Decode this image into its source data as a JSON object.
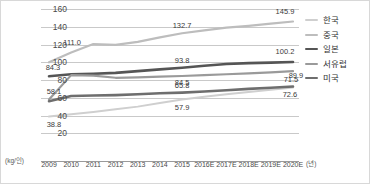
{
  "chart_data": {
    "type": "line",
    "title": "",
    "xlabel": "(년)",
    "ylabel": "(kg/인)",
    "ylim": [
      0,
      160
    ],
    "yticks": [
      160,
      140,
      120,
      100,
      80,
      60,
      40,
      20
    ],
    "grid": true,
    "legend_position": "right",
    "categories": [
      "2009",
      "2010",
      "2011",
      "2012",
      "2013",
      "2014",
      "2015",
      "2016E",
      "2017E",
      "2018E",
      "2019E",
      "2020E"
    ],
    "series": [
      {
        "name": "한국",
        "color": "#cfcfcf",
        "width": 2.0,
        "values": [
          38.8,
          41.5,
          44.0,
          47.0,
          50.0,
          54.0,
          57.9,
          61.0,
          64.0,
          66.5,
          69.0,
          71.5
        ]
      },
      {
        "name": "중국",
        "color": "#bdbdbd",
        "width": 2.2,
        "values": [
          100.0,
          111.0,
          120.5,
          119.5,
          123.0,
          128.0,
          132.7,
          136.0,
          139.0,
          141.0,
          143.5,
          145.9
        ]
      },
      {
        "name": "일본",
        "color": "#555555",
        "width": 2.6,
        "values": [
          84.3,
          86.5,
          87.0,
          88.0,
          90.0,
          92.0,
          93.8,
          96.0,
          98.0,
          99.0,
          99.6,
          100.2
        ]
      },
      {
        "name": "서유럽",
        "color": "#9a9a9a",
        "width": 2.2,
        "values": [
          58.1,
          85.5,
          85.0,
          82.5,
          83.0,
          83.8,
          84.5,
          85.5,
          86.5,
          87.5,
          88.7,
          89.9
        ]
      },
      {
        "name": "미국",
        "color": "#6e6e6e",
        "width": 2.6,
        "values": [
          56.0,
          62.0,
          62.5,
          63.0,
          64.0,
          65.0,
          65.8,
          67.0,
          68.5,
          70.0,
          71.3,
          72.6
        ]
      }
    ],
    "annotations": [
      {
        "text": "111.0",
        "series": "중국",
        "index": 1,
        "dx": 1,
        "dy": -9,
        "align": "center"
      },
      {
        "text": "132.7",
        "series": "중국",
        "index": 6,
        "dx": 0,
        "dy": -7,
        "align": "center"
      },
      {
        "text": "145.9",
        "series": "중국",
        "index": 11,
        "dx": -8,
        "dy": -10,
        "align": "center"
      },
      {
        "text": "84.3",
        "series": "일본",
        "index": 0,
        "dx": 4,
        "dy": -8,
        "align": "center"
      },
      {
        "text": "93.8",
        "series": "일본",
        "index": 6,
        "dx": 0,
        "dy": -7,
        "align": "center"
      },
      {
        "text": "100.2",
        "series": "일본",
        "index": 11,
        "dx": -8,
        "dy": -10,
        "align": "center"
      },
      {
        "text": "84.5",
        "series": "서유럽",
        "index": 6,
        "dx": 0,
        "dy": 7,
        "align": "center"
      },
      {
        "text": "89.9",
        "series": "서유럽",
        "index": 11,
        "dx": 3,
        "dy": 5,
        "align": "center"
      },
      {
        "text": "58.1",
        "series": "서유럽",
        "index": 0,
        "dx": 5,
        "dy": -7,
        "align": "center"
      },
      {
        "text": "65.8",
        "series": "미국",
        "index": 6,
        "dx": 0,
        "dy": -7,
        "align": "center"
      },
      {
        "text": "72.6",
        "series": "미국",
        "index": 11,
        "dx": -3,
        "dy": 8,
        "align": "center"
      },
      {
        "text": "38.8",
        "series": "한국",
        "index": 0,
        "dx": 5,
        "dy": 8,
        "align": "center"
      },
      {
        "text": "57.9",
        "series": "한국",
        "index": 6,
        "dx": 0,
        "dy": 8,
        "align": "center"
      },
      {
        "text": "71.5",
        "series": "한국",
        "index": 11,
        "dx": -2,
        "dy": -8,
        "align": "center"
      }
    ]
  },
  "legend": {
    "items": [
      {
        "label": "한국"
      },
      {
        "label": "중국"
      },
      {
        "label": "일본"
      },
      {
        "label": "서유럽"
      },
      {
        "label": "미국"
      }
    ]
  }
}
